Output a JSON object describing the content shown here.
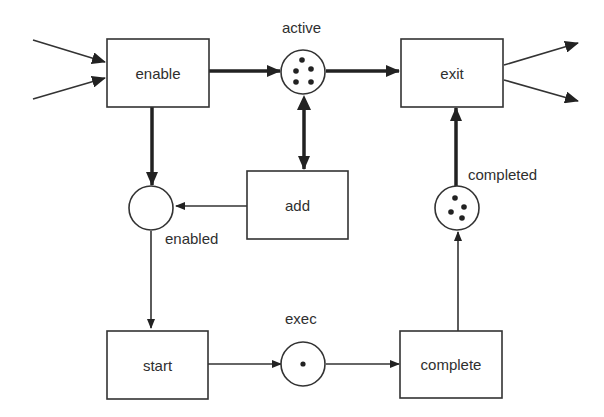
{
  "diagram": {
    "type": "petri-net",
    "transitions": [
      {
        "id": "enable",
        "label": "enable"
      },
      {
        "id": "exit",
        "label": "exit"
      },
      {
        "id": "add",
        "label": "add"
      },
      {
        "id": "start",
        "label": "start"
      },
      {
        "id": "complete",
        "label": "complete"
      }
    ],
    "places": [
      {
        "id": "active",
        "label": "active",
        "tokens": 5
      },
      {
        "id": "enabled",
        "label": "enabled",
        "tokens": 0
      },
      {
        "id": "completed",
        "label": "completed",
        "tokens": 4
      },
      {
        "id": "exec",
        "label": "exec",
        "tokens": 1
      }
    ],
    "arcs": [
      {
        "from": "input",
        "to": "enable",
        "weight": "thin"
      },
      {
        "from": "input",
        "to": "enable",
        "weight": "thin"
      },
      {
        "from": "enable",
        "to": "active",
        "weight": "thick"
      },
      {
        "from": "active",
        "to": "exit",
        "weight": "thick"
      },
      {
        "from": "exit",
        "to": "output",
        "weight": "thin"
      },
      {
        "from": "exit",
        "to": "output",
        "weight": "thin"
      },
      {
        "from": "enable",
        "to": "enabled",
        "weight": "thick"
      },
      {
        "from": "active",
        "to": "add",
        "weight": "thick",
        "bidirectional": true
      },
      {
        "from": "add",
        "to": "enabled",
        "weight": "thin"
      },
      {
        "from": "enabled",
        "to": "start",
        "weight": "thin"
      },
      {
        "from": "start",
        "to": "exec",
        "weight": "thin"
      },
      {
        "from": "exec",
        "to": "complete",
        "weight": "thin"
      },
      {
        "from": "complete",
        "to": "completed",
        "weight": "thin"
      },
      {
        "from": "completed",
        "to": "exit",
        "weight": "thick"
      }
    ]
  }
}
